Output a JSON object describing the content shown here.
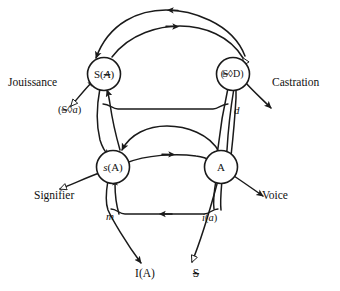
{
  "figure": {
    "background_color": "#ffffff",
    "ink_color": "#1a1a1a"
  },
  "nodes": [
    {
      "id": "s-barred-A",
      "label": "S(Ⱥ)",
      "label_plain": "S(A-barred)",
      "position": "upper-left",
      "cx": 104,
      "cy": 74
    },
    {
      "id": "barred-S-lozenge-D",
      "label": "($◊D)",
      "label_plain": "(barred-S lozenge D)",
      "position": "upper-right",
      "cx": 233,
      "cy": 74
    },
    {
      "id": "s-of-A",
      "label": "s(A)",
      "label_plain": "s(A)",
      "position": "lower-left",
      "cx": 113,
      "cy": 167
    },
    {
      "id": "big-A",
      "label": "A",
      "label_plain": "A",
      "position": "lower-right",
      "cx": 221,
      "cy": 167
    }
  ],
  "outer_labels": [
    {
      "id": "jouissance",
      "text": "Jouissance",
      "side": "left",
      "x": 8,
      "y": 86
    },
    {
      "id": "castration",
      "text": "Castration",
      "side": "right",
      "x": 272,
      "y": 86
    },
    {
      "id": "signifier",
      "text": "Signifier",
      "side": "left",
      "x": 34,
      "y": 196
    },
    {
      "id": "voice",
      "text": "Voice",
      "side": "right",
      "x": 262,
      "y": 196
    }
  ],
  "edge_labels": [
    {
      "id": "fantasy-matheme",
      "text": "($◊a)",
      "text_plain": "(barred-S lozenge a)",
      "x": 62,
      "y": 110
    },
    {
      "id": "desire-d",
      "text": "d",
      "x": 235,
      "y": 110
    },
    {
      "id": "message-m",
      "text": "m",
      "x": 113,
      "y": 216
    },
    {
      "id": "imaginary-i-a",
      "text": "i(a)",
      "text_plain": "i(a)",
      "x": 205,
      "y": 217
    }
  ],
  "terminals": [
    {
      "id": "ego-ideal",
      "text": "I(A)",
      "text_plain": "I(A)",
      "x": 145,
      "y": 272,
      "marker": "arrowhead-filled"
    },
    {
      "id": "barred-subject",
      "text": "$",
      "text_plain": "barred-S",
      "x": 196,
      "y": 272,
      "marker": "hollow-triangle"
    }
  ],
  "legend": {
    "upper_graph": "Upper (signifying/jouissance) circuit",
    "lower_graph": "Lower (imaginary/speech) circuit"
  }
}
